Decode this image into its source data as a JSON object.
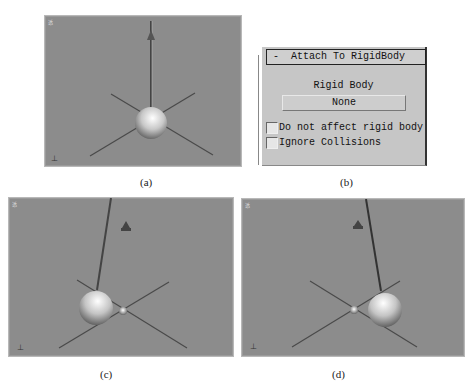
{
  "figure": {
    "panels": [
      {
        "id": "a",
        "caption": "(a)",
        "viewport_label": "透"
      },
      {
        "id": "b",
        "caption": "(b)"
      },
      {
        "id": "c",
        "caption": "(c)",
        "viewport_label": "透"
      },
      {
        "id": "d",
        "caption": "(d)",
        "viewport_label": "透"
      }
    ]
  },
  "rollout": {
    "collapse_symbol": "-",
    "title": "Attach To RigidBody",
    "rigid_body_label": "Rigid Body",
    "rigid_body_button": "None",
    "checkboxes": [
      {
        "label": "Do not affect rigid body",
        "checked": false
      },
      {
        "label": "Ignore Collisions",
        "checked": false
      }
    ]
  },
  "colors": {
    "viewport_bg": "#8c8c8c",
    "panel_bg": "#c6c6c6",
    "grid_line": "#4a4a4a"
  }
}
